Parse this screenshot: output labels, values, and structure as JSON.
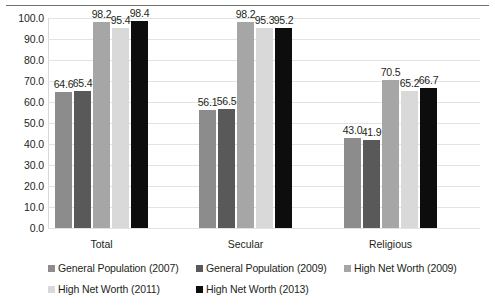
{
  "chart_data": {
    "type": "bar",
    "title": "",
    "subtitle": "",
    "xlabel": "",
    "ylabel": "",
    "categories": [
      "Total",
      "Secular",
      "Religious"
    ],
    "ylim": [
      0,
      100
    ],
    "ytick_step": 10,
    "ytick_labels": [
      "100.0",
      "90.0",
      "80.0",
      "70.0",
      "60.0",
      "50.0",
      "40.0",
      "30.0",
      "20.0",
      "10.0",
      "0.0"
    ],
    "ytick_values": [
      100,
      90,
      80,
      70,
      60,
      50,
      40,
      30,
      20,
      10,
      0
    ],
    "grid": true,
    "legend_position": "bottom",
    "series": [
      {
        "name": "General Population (2007)",
        "color": "#8c8c8c",
        "values": [
          64.6,
          56.1,
          43.0
        ],
        "labels": [
          "64.6",
          "56.1",
          "43.0"
        ]
      },
      {
        "name": "General Population (2009)",
        "color": "#595959",
        "values": [
          65.4,
          56.5,
          41.9
        ],
        "labels": [
          "65.4",
          "56.5",
          "41.9"
        ]
      },
      {
        "name": "High Net Worth (2009)",
        "color": "#a6a6a6",
        "values": [
          98.2,
          98.2,
          70.5
        ],
        "labels": [
          "98.2",
          "98.2",
          "70.5"
        ]
      },
      {
        "name": "High Net Worth (2011)",
        "color": "#d9d9d9",
        "values": [
          95.4,
          95.3,
          65.2
        ],
        "labels": [
          "95.4",
          "95.3",
          "65.2"
        ]
      },
      {
        "name": "High Net Worth (2013)",
        "color": "#0d0d0d",
        "values": [
          98.4,
          95.2,
          66.7
        ],
        "labels": [
          "98.4",
          "95.2",
          "66.7"
        ]
      }
    ]
  },
  "legend": {
    "rows": [
      [
        {
          "label": "General Population (2007)",
          "color": "#8c8c8c"
        },
        {
          "label": "General Population (2009)",
          "color": "#595959"
        },
        {
          "label": "High Net Worth (2009)",
          "color": "#a6a6a6"
        }
      ],
      [
        {
          "label": "High Net Worth (2011)",
          "color": "#d9d9d9"
        },
        {
          "label": "High Net Worth (2013)",
          "color": "#0d0d0d"
        }
      ]
    ]
  }
}
